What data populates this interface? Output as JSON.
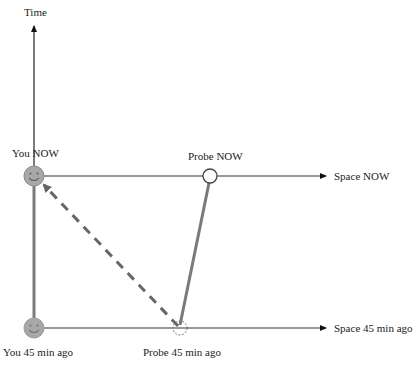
{
  "diagram": {
    "axes": {
      "time_label": "Time",
      "space_now_label": "Space NOW",
      "space_past_label": "Space 45 min ago"
    },
    "events": {
      "you_now": "You NOW",
      "you_past": "You 45 min ago",
      "probe_now": "Probe NOW",
      "probe_past": "Probe 45 min ago"
    },
    "colors": {
      "axis": "#333333",
      "worldline": "#7a7a7a",
      "signal": "#666666",
      "smiley_fill": "#a8a8a8",
      "probe_stroke": "#444444"
    },
    "icons": {
      "you": "smiley-face-icon",
      "probe": "circle-icon"
    }
  }
}
